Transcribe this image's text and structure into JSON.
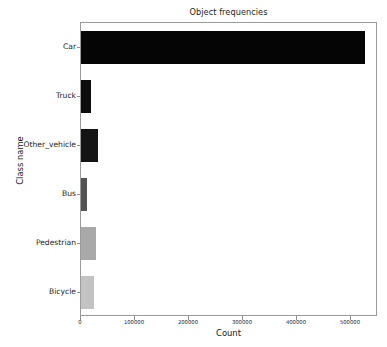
{
  "chart_data": {
    "type": "bar",
    "orientation": "horizontal",
    "title": "Object frequencies",
    "xlabel": "Count",
    "ylabel": "Class name",
    "categories": [
      "Car",
      "Truck",
      "Other_vehicle",
      "Bus",
      "Pedestrian",
      "Bicycle"
    ],
    "values": [
      526000,
      19000,
      31000,
      11000,
      28000,
      24000
    ],
    "bar_colors": [
      "#050505",
      "#0d0d0d",
      "#141414",
      "#545454",
      "#a9a9a9",
      "#c3c3c3"
    ],
    "xlim": [
      0,
      550000
    ],
    "xticks": [
      0,
      100000,
      200000,
      300000,
      400000,
      500000
    ],
    "xticklabels": [
      "0",
      "100000",
      "200000",
      "300000",
      "400000",
      "500000"
    ],
    "grid": false,
    "legend": null,
    "series": [
      {
        "name": "Count",
        "points": [
          {
            "category": "Car",
            "value": 526000,
            "color": "#050505"
          },
          {
            "category": "Truck",
            "value": 19000,
            "color": "#0d0d0d"
          },
          {
            "category": "Other_vehicle",
            "value": 31000,
            "color": "#141414"
          },
          {
            "category": "Bus",
            "value": 11000,
            "color": "#545454"
          },
          {
            "category": "Pedestrian",
            "value": 28000,
            "color": "#a9a9a9"
          },
          {
            "category": "Bicycle",
            "value": 24000,
            "color": "#c3c3c3"
          }
        ]
      }
    ]
  },
  "figure": {
    "background": "#ffffff",
    "axes_edge_color": "#9a9a9a",
    "tick_color": "#8d8d8d"
  }
}
